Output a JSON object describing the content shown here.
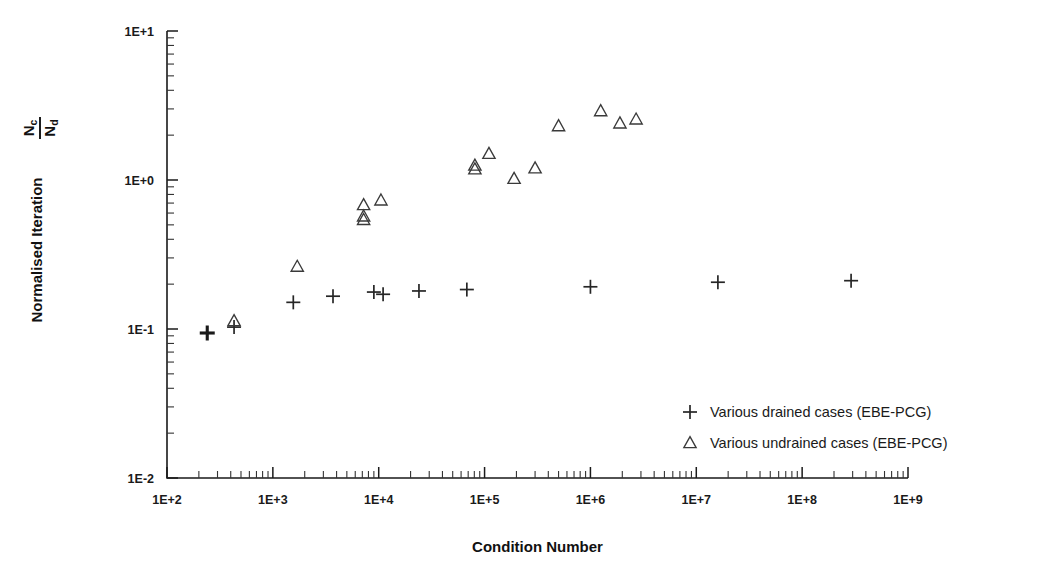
{
  "chart_data": {
    "type": "scatter",
    "title": "",
    "xlabel": "Condition Number",
    "ylabel": "Normalised Iteration",
    "ylabel_fraction": {
      "numerator": "N",
      "numerator_sub": "c",
      "denominator": "N",
      "denominator_sub": "d"
    },
    "xscale": "log",
    "yscale": "log",
    "xlim": [
      100,
      1000000000
    ],
    "ylim": [
      0.01,
      10
    ],
    "grid": false,
    "xticklabels": [
      "1E+2",
      "1E+3",
      "1E+4",
      "1E+5",
      "1E+6",
      "1E+7",
      "1E+8",
      "1E+9"
    ],
    "xtickvalues": [
      100,
      1000,
      10000,
      100000,
      1000000,
      10000000,
      100000000,
      1000000000
    ],
    "yticklabels": [
      "1E+1",
      "1E+0",
      "1E-1",
      "1E-2"
    ],
    "ytickvalues": [
      10,
      1,
      0.1,
      0.01
    ],
    "minor_ticks": true,
    "legend_position": "center-right-lower",
    "series": [
      {
        "name": "Various drained cases (EBE-PCG)",
        "marker": "plus",
        "points": [
          {
            "x": 240,
            "y": 0.094,
            "overlapped": true
          },
          {
            "x": 430,
            "y": 0.103
          },
          {
            "x": 1560,
            "y": 0.151
          },
          {
            "x": 3700,
            "y": 0.166
          },
          {
            "x": 9000,
            "y": 0.177
          },
          {
            "x": 24000,
            "y": 0.18
          },
          {
            "x": 68000,
            "y": 0.184
          },
          {
            "x": 1000000,
            "y": 0.192
          },
          {
            "x": 11000,
            "y": 0.171
          },
          {
            "x": 16000000,
            "y": 0.206
          },
          {
            "x": 290000000,
            "y": 0.211
          }
        ]
      },
      {
        "name": "Various undrained cases (EBE-PCG)",
        "marker": "triangle",
        "points": [
          {
            "x": 430,
            "y": 0.113
          },
          {
            "x": 1700,
            "y": 0.262
          },
          {
            "x": 7200,
            "y": 0.54,
            "overlapped": true
          },
          {
            "x": 7200,
            "y": 0.57
          },
          {
            "x": 7200,
            "y": 0.68
          },
          {
            "x": 10500,
            "y": 0.73
          },
          {
            "x": 81000,
            "y": 1.18,
            "overlapped": true
          },
          {
            "x": 81000,
            "y": 1.25
          },
          {
            "x": 110000,
            "y": 1.5
          },
          {
            "x": 190000,
            "y": 1.02
          },
          {
            "x": 300000,
            "y": 1.2
          },
          {
            "x": 500000,
            "y": 2.3
          },
          {
            "x": 1250000,
            "y": 2.9
          },
          {
            "x": 1900000,
            "y": 2.4
          },
          {
            "x": 2700000,
            "y": 2.55
          }
        ]
      }
    ],
    "legend": [
      {
        "marker": "plus",
        "label": "Various drained cases (EBE-PCG)"
      },
      {
        "marker": "triangle",
        "label": "Various undrained cases (EBE-PCG)"
      }
    ],
    "colors": {
      "marker": "#262626",
      "axis": "#1a1a1a",
      "background": "#ffffff"
    }
  }
}
